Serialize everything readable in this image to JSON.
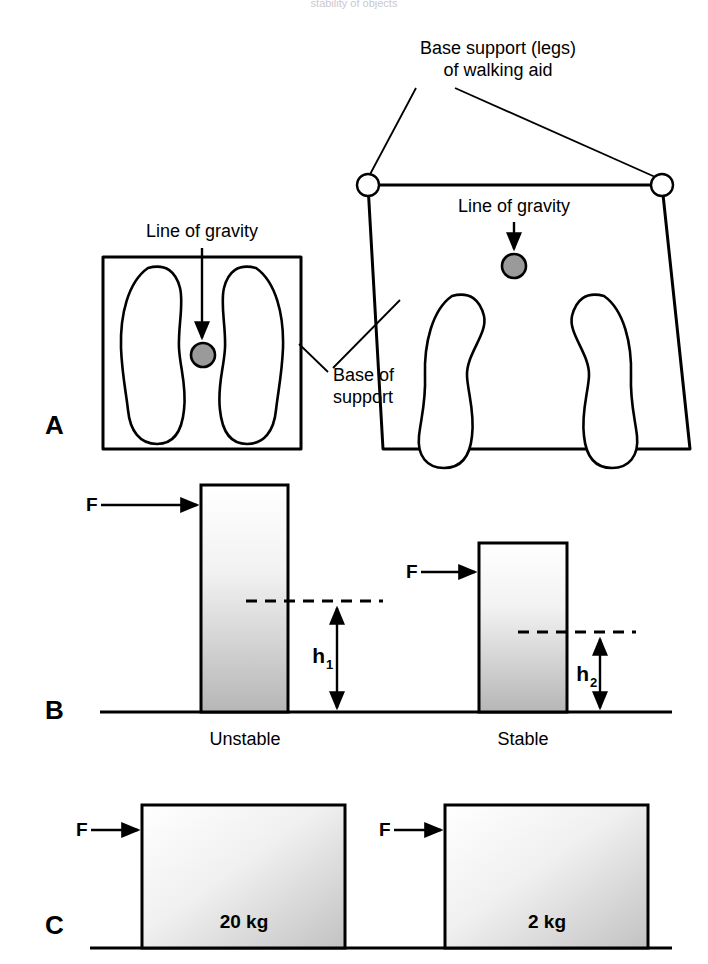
{
  "figure": {
    "top_caption": "stability of objects",
    "panels": [
      {
        "letter": "A",
        "name": "base-of-support-panel"
      },
      {
        "letter": "B",
        "name": "height-of-cog-panel"
      },
      {
        "letter": "C",
        "name": "mass-panel"
      }
    ]
  },
  "panel_a": {
    "letter": "A",
    "label_base_support_line1": "Base support (legs)",
    "label_base_support_line2": "of walking aid",
    "label_line_of_gravity_left": "Line of gravity",
    "label_line_of_gravity_right": "Line of gravity",
    "label_base_of_support_line1": "Base of",
    "label_base_of_support_line2": "support",
    "cog_color": "#9a9a9a"
  },
  "panel_b": {
    "letter": "B",
    "force_label_left": "F",
    "force_label_right": "F",
    "height_label_left": "h",
    "height_sub_left": "1",
    "height_label_right": "h",
    "height_sub_right": "2",
    "caption_left": "Unstable",
    "caption_right": "Stable"
  },
  "panel_c": {
    "letter": "C",
    "force_label_left": "F",
    "force_label_right": "F",
    "mass_left": "20 kg",
    "mass_right": "2 kg"
  },
  "colors": {
    "ink": "#000000",
    "paper": "#ffffff",
    "cog_gray": "#9a9a9a",
    "block_gradient_top": "#ffffff",
    "block_gradient_bottom": "#b4b4b4"
  }
}
